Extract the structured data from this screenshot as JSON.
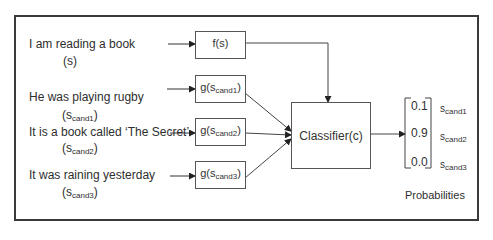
{
  "inputs": [
    {
      "sentence": "I am reading a book",
      "symbol_main": "(s",
      "symbol_sub": "",
      "symbol_close": ")"
    },
    {
      "sentence": "He was playing rugby",
      "symbol_main": "(s",
      "symbol_sub": "cand1",
      "symbol_close": ")"
    },
    {
      "sentence": "It is a book called ‘The Secret’",
      "symbol_main": "(s",
      "symbol_sub": "cand2",
      "symbol_close": ")"
    },
    {
      "sentence": "It was raining yesterday",
      "symbol_main": "(s",
      "symbol_sub": "cand3",
      "symbol_close": ")"
    }
  ],
  "encoders": [
    {
      "main": "f(s)",
      "sub": "",
      "close": ""
    },
    {
      "main": "g(s",
      "sub": "cand1",
      "close": ")"
    },
    {
      "main": "g(s",
      "sub": "cand2",
      "close": ")"
    },
    {
      "main": "g(s",
      "sub": "cand3",
      "close": ")"
    }
  ],
  "classifier": {
    "label": "Classifier(c)"
  },
  "output": {
    "values": [
      "0.1",
      "0.9",
      "0.0"
    ],
    "labels": [
      {
        "main": "s",
        "sub": "cand1"
      },
      {
        "main": "s",
        "sub": "cand2"
      },
      {
        "main": "s",
        "sub": "cand3"
      }
    ],
    "caption": "Probabilities"
  }
}
